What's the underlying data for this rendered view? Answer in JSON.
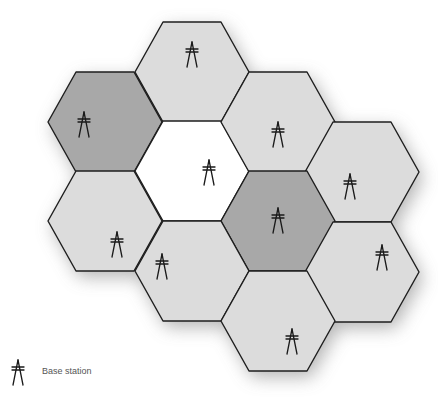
{
  "diagram": {
    "type": "cellular-network-hexagon-layout",
    "colors": {
      "light": "#dcdcdc",
      "dark": "#a8a8a8",
      "white": "#ffffff",
      "stroke": "#1e1e1e",
      "shadow": "#9a9a9a"
    },
    "hex": {
      "half_width": 57,
      "half_height": 50,
      "top_half": 29
    },
    "cells": [
      {
        "id": "A",
        "cx": 192,
        "cy": 72,
        "shade": "light",
        "antenna": [
          192,
          54
        ]
      },
      {
        "id": "B",
        "cx": 105,
        "cy": 122,
        "shade": "dark",
        "antenna": [
          84,
          124
        ]
      },
      {
        "id": "C",
        "cx": 192,
        "cy": 171,
        "shade": "white",
        "antenna": [
          209,
          172
        ]
      },
      {
        "id": "D",
        "cx": 278,
        "cy": 122,
        "shade": "light",
        "antenna": [
          278,
          134
        ]
      },
      {
        "id": "E",
        "cx": 362,
        "cy": 172,
        "shade": "light",
        "antenna": [
          350,
          186
        ]
      },
      {
        "id": "F",
        "cx": 278,
        "cy": 221,
        "shade": "dark",
        "antenna": [
          278,
          220
        ]
      },
      {
        "id": "G",
        "cx": 105,
        "cy": 221,
        "shade": "light",
        "antenna": [
          117,
          244
        ]
      },
      {
        "id": "H",
        "cx": 192,
        "cy": 271,
        "shade": "light",
        "antenna": [
          162,
          266
        ]
      },
      {
        "id": "I",
        "cx": 362,
        "cy": 272,
        "shade": "light",
        "antenna": [
          382,
          257
        ]
      },
      {
        "id": "J",
        "cx": 278,
        "cy": 321,
        "shade": "light",
        "antenna": [
          292,
          341
        ]
      }
    ]
  },
  "legend": {
    "icon": "antenna-tower-icon",
    "label": "Base station",
    "icon_pos": [
      18,
      372
    ]
  }
}
